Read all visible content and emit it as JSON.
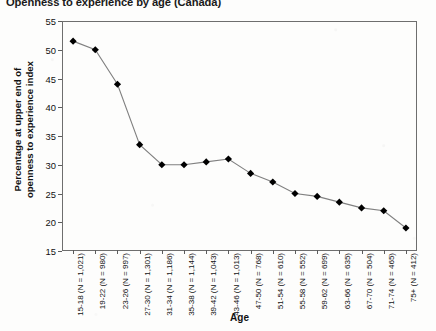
{
  "chart_data": {
    "type": "line",
    "title": "Openness to experience by age (Canada)",
    "xlabel": "Age",
    "ylabel": "Percentage at upper end of openness to experience index",
    "ylabel_line1": "Percentage at upper end of",
    "ylabel_line2": "openness to experience index",
    "ylim": [
      15,
      55
    ],
    "yticks": [
      15,
      20,
      25,
      30,
      35,
      40,
      45,
      50,
      55
    ],
    "grid": false,
    "legend_position": "none",
    "marker": "filled-diamond",
    "line_color": "#808080",
    "marker_color": "#000000",
    "categories": [
      "15-18 (N = 1,021)",
      "19-22 (N = 980)",
      "23-26 (N = 997)",
      "27-30 (N = 1,301)",
      "31-34 (N = 1,186)",
      "35-38 (N = 1,144)",
      "39-42 (N = 1,043)",
      "43-46 (N = 1,013)",
      "47-50 (N = 768)",
      "51-54 (N = 610)",
      "55-58 (N = 552)",
      "59-62 (N = 699)",
      "63-66 (N = 635)",
      "67-70 (N = 504)",
      "71-74 (N = 465)",
      "75+ (N = 412)"
    ],
    "age_groups": [
      "15-18",
      "19-22",
      "23-26",
      "27-30",
      "31-34",
      "35-38",
      "39-42",
      "43-46",
      "47-50",
      "51-54",
      "55-58",
      "59-62",
      "63-66",
      "67-70",
      "71-74",
      "75+"
    ],
    "sample_sizes": [
      1021,
      980,
      997,
      1301,
      1186,
      1144,
      1043,
      1013,
      768,
      610,
      552,
      699,
      635,
      504,
      465,
      412
    ],
    "values": [
      51.5,
      50.0,
      44.0,
      33.5,
      30.0,
      30.0,
      30.5,
      31.0,
      28.5,
      27.0,
      25.0,
      24.5,
      23.5,
      22.5,
      22.0,
      19.0
    ]
  }
}
